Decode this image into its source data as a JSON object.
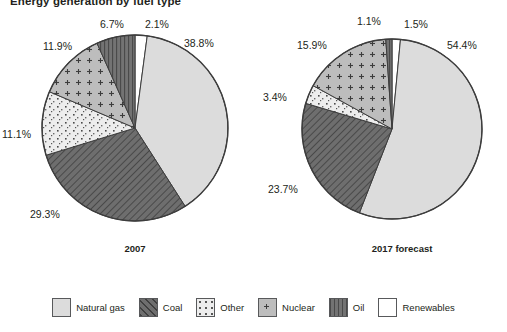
{
  "chart_data": {
    "type": "pie",
    "title": "Energy generation by fuel type",
    "xlabel": "",
    "ylabel": "",
    "legend_position": "bottom",
    "grid": false,
    "categories": [
      "Natural gas",
      "Coal",
      "Other",
      "Nuclear",
      "Oil",
      "Renewables"
    ],
    "series": [
      {
        "name": "2007",
        "values": [
          38.8,
          29.3,
          11.1,
          11.9,
          6.7,
          2.1
        ],
        "labels": [
          "38.8%",
          "29.3%",
          "11.1%",
          "11.9%",
          "6.7%",
          "2.1%"
        ]
      },
      {
        "name": "2017 forecast",
        "values": [
          54.4,
          23.7,
          3.4,
          15.9,
          1.1,
          1.5
        ],
        "labels": [
          "54.4%",
          "23.7%",
          "3.4%",
          "15.9%",
          "1.1%",
          "1.5%"
        ]
      }
    ],
    "colors": {
      "natural_gas": "#dcdcdc",
      "coal": "#6e6e6e",
      "other": "#eaeaea",
      "nuclear": "#bdbdbd",
      "oil": "#737373",
      "renewables": "#ffffff",
      "outline": "#3d3d3d"
    }
  },
  "title": "Energy generation by fuel type",
  "pies": [
    {
      "caption": "2007",
      "slices": [
        {
          "key": "renewables",
          "label": "2.1%",
          "value": 2.1
        },
        {
          "key": "natural_gas",
          "label": "38.8%",
          "value": 38.8
        },
        {
          "key": "coal",
          "label": "29.3%",
          "value": 29.3
        },
        {
          "key": "other",
          "label": "11.1%",
          "value": 11.1
        },
        {
          "key": "nuclear",
          "label": "11.9%",
          "value": 11.9
        },
        {
          "key": "oil",
          "label": "6.7%",
          "value": 6.7
        }
      ]
    },
    {
      "caption": "2017 forecast",
      "slices": [
        {
          "key": "renewables",
          "label": "1.5%",
          "value": 1.5
        },
        {
          "key": "natural_gas",
          "label": "54.4%",
          "value": 54.4
        },
        {
          "key": "coal",
          "label": "23.7%",
          "value": 23.7
        },
        {
          "key": "other",
          "label": "3.4%",
          "value": 3.4
        },
        {
          "key": "nuclear",
          "label": "15.9%",
          "value": 15.9
        },
        {
          "key": "oil",
          "label": "1.1%",
          "value": 1.1
        }
      ]
    }
  ],
  "pie_left": {
    "caption": "2007",
    "pct_natural_gas": "38.8%",
    "pct_coal": "29.3%",
    "pct_other": "11.1%",
    "pct_nuclear": "11.9%",
    "pct_oil": "6.7%",
    "pct_renewables": "2.1%"
  },
  "pie_right": {
    "caption": "2017 forecast",
    "pct_natural_gas": "54.4%",
    "pct_coal": "23.7%",
    "pct_other": "3.4%",
    "pct_nuclear": "15.9%",
    "pct_oil": "1.1%",
    "pct_renewables": "1.5%"
  },
  "legend": {
    "items": [
      {
        "key": "natural_gas",
        "label": "Natural gas"
      },
      {
        "key": "coal",
        "label": "Coal"
      },
      {
        "key": "other",
        "label": "Other"
      },
      {
        "key": "nuclear",
        "label": "Nuclear"
      },
      {
        "key": "oil",
        "label": "Oil"
      },
      {
        "key": "renewables",
        "label": "Renewables"
      }
    ]
  }
}
